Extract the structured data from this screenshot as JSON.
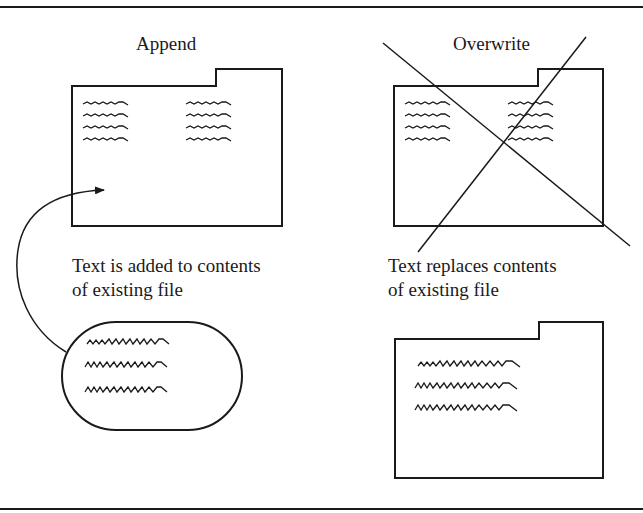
{
  "diagram": {
    "panels": [
      {
        "id": "append",
        "title": "Append",
        "caption_line1": "Text is added to contents",
        "caption_line2": "of existing file",
        "existing_file_icon": "folder-icon",
        "new_text_icon": "text-blob-icon",
        "arrow_icon": "curved-arrow-icon"
      },
      {
        "id": "overwrite",
        "title": "Overwrite",
        "caption_line1": "Text replaces contents",
        "caption_line2": "of existing file",
        "existing_file_icon": "folder-icon",
        "crossed_out_icon": "x-cross-icon",
        "result_file_icon": "folder-icon"
      }
    ],
    "colors": {
      "ink": "#1a1a1a",
      "background": "#ffffff"
    }
  }
}
